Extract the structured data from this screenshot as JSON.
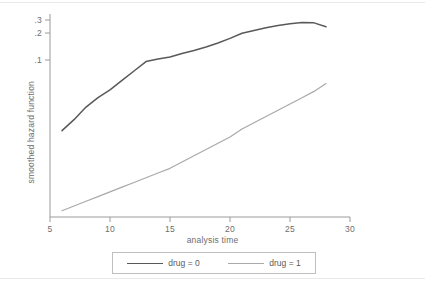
{
  "chart_data": {
    "type": "line",
    "title": "",
    "xlabel": "analysis time",
    "ylabel": "smoothed hazard function",
    "xlim": [
      5,
      30
    ],
    "ylim": [
      0,
      0.32
    ],
    "xticks": [
      "5",
      "10",
      "15",
      "20",
      "25",
      "30"
    ],
    "yticks": [
      ".1",
      ".2",
      ".3"
    ],
    "grid": false,
    "legend_position": "bottom",
    "series": [
      {
        "name": "drug = 0",
        "color": "#595959",
        "x": [
          6.0,
          7.0,
          8.0,
          9.0,
          10.0,
          11.0,
          12.0,
          13.0,
          14.0,
          15.0,
          16.0,
          17.0,
          18.0,
          19.0,
          20.0,
          21.0,
          22.0,
          23.0,
          24.0,
          25.0,
          26.0,
          27.0,
          28.0
        ],
        "y": [
          0.055,
          0.062,
          0.07,
          0.076,
          0.081,
          0.087,
          0.093,
          0.099,
          0.104,
          0.111,
          0.124,
          0.135,
          0.148,
          0.163,
          0.18,
          0.199,
          0.219,
          0.24,
          0.258,
          0.272,
          0.28,
          0.278,
          0.248
        ]
      },
      {
        "name": "drug = 1",
        "color": "#a9a9a9",
        "x": [
          6.0,
          7.0,
          8.0,
          9.0,
          10.0,
          11.0,
          12.0,
          13.0,
          14.0,
          15.0,
          16.0,
          17.0,
          18.0,
          19.0,
          20.0,
          21.0,
          22.0,
          23.0,
          24.0,
          25.0,
          26.0,
          27.0,
          28.0
        ],
        "y": [
          0.004,
          0.007,
          0.01,
          0.013,
          0.016,
          0.019,
          0.022,
          0.025,
          0.028,
          0.031,
          0.035,
          0.039,
          0.043,
          0.047,
          0.051,
          0.056,
          0.06,
          0.064,
          0.068,
          0.072,
          0.076,
          0.08,
          0.085
        ]
      }
    ]
  },
  "axes": {
    "x_title": "analysis time",
    "y_title": "smoothed hazard function",
    "x_ticks": [
      "5",
      "10",
      "15",
      "20",
      "25",
      "30"
    ],
    "y_ticks": [
      ".3",
      ".2",
      ".1"
    ]
  },
  "legend": {
    "entries": [
      {
        "label": "drug = 0",
        "color": "#595959"
      },
      {
        "label": "drug = 1",
        "color": "#a9a9a9"
      }
    ]
  },
  "colors": {
    "axis": "#9a9a9a",
    "text": "#6e6e6e",
    "frame": "#e9eaee",
    "background": "#ffffff",
    "series_0": "#595959",
    "series_1": "#a9a9a9"
  }
}
